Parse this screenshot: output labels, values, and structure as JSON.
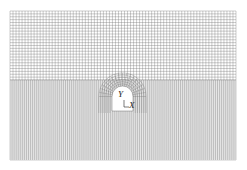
{
  "figure": {
    "type": "finite-element-mesh",
    "background": "#ffffff",
    "mesh_color": "#6e6e6e",
    "mesh_bounds": {
      "x0": 10,
      "y0": 11,
      "x1": 236,
      "y1": 160
    },
    "upper_region": {
      "y0": 11,
      "y1": 80,
      "cols": 75,
      "rows": 24
    },
    "lower_region": {
      "y0": 80,
      "y1": 160,
      "cols": 110,
      "rows": 40
    },
    "tunnel": {
      "cx": 122.5,
      "top": 86,
      "bottom": 111,
      "half_width": 10.5,
      "arch_radius": 10.5
    },
    "axes": {
      "y_label": "Y",
      "x_label": "X"
    }
  }
}
